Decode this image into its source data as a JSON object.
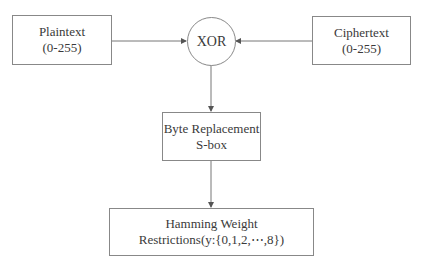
{
  "diagram": {
    "nodes": {
      "plaintext": {
        "line1": "Plaintext",
        "line2": "(0-255)"
      },
      "xor": {
        "label": "XOR"
      },
      "ciphertext": {
        "line1": "Ciphertext",
        "line2": "(0-255)"
      },
      "sbox": {
        "line1": "Byte Replacement",
        "line2": "S-box"
      },
      "hamming": {
        "line1": "Hamming Weight",
        "line2": "Restrictions(y:{0,1,2,⋯,8})"
      }
    },
    "edges": [
      {
        "from": "plaintext",
        "to": "xor"
      },
      {
        "from": "ciphertext",
        "to": "xor"
      },
      {
        "from": "xor",
        "to": "sbox"
      },
      {
        "from": "sbox",
        "to": "hamming"
      }
    ],
    "colors": {
      "stroke": "#888888",
      "text": "#3a3a3a",
      "background": "#ffffff"
    }
  }
}
